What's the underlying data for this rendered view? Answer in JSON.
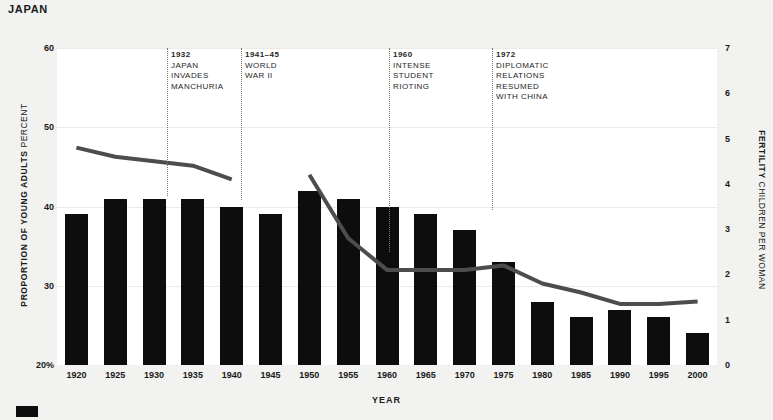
{
  "header": {
    "country": "JAPAN"
  },
  "axes": {
    "left_title_main": "PROPORTION OF YOUNG ADULTS",
    "left_title_sub": "PERCENT",
    "right_title_main": "FERTILITY",
    "right_title_sub": "CHILDREN PER WOMAN",
    "x_title": "YEAR",
    "left_ticks": [
      "60",
      "50",
      "40",
      "30",
      "20%"
    ],
    "right_ticks": [
      "7",
      "6",
      "5",
      "4",
      "3",
      "2",
      "1",
      "0"
    ]
  },
  "events": [
    {
      "year": "1932",
      "text": "JAPAN\nINVADES\nMANCHURIA"
    },
    {
      "year": "1941–45",
      "text": "WORLD\nWAR II"
    },
    {
      "year": "1960",
      "text": "INTENSE\nSTUDENT\nRIOTING"
    },
    {
      "year": "1972",
      "text": "DIPLOMATIC\nRELATIONS\nRESUMED\nWITH CHINA"
    }
  ],
  "chart_data": {
    "type": "bar",
    "title": "JAPAN",
    "xlabel": "YEAR",
    "ylabel": "PROPORTION OF YOUNG ADULTS PERCENT",
    "ylabel_right": "FERTILITY CHILDREN PER WOMAN",
    "ylim": [
      20,
      60
    ],
    "ylim_right": [
      0,
      7
    ],
    "grid": true,
    "legend": "none",
    "categories": [
      "1920",
      "1925",
      "1930",
      "1935",
      "1940",
      "1945",
      "1950",
      "1955",
      "1960",
      "1965",
      "1970",
      "1975",
      "1980",
      "1985",
      "1990",
      "1995",
      "2000"
    ],
    "series": [
      {
        "name": "PROPORTION OF YOUNG ADULTS",
        "type": "bar",
        "unit": "percent",
        "values": [
          39,
          41,
          41,
          41,
          40,
          39,
          42,
          41,
          40,
          39,
          37,
          33,
          28,
          26,
          27,
          26,
          24
        ]
      },
      {
        "name": "FERTILITY",
        "type": "line",
        "unit": "children per woman",
        "values": [
          4.8,
          4.6,
          4.5,
          4.4,
          4.1,
          null,
          4.2,
          2.8,
          2.1,
          2.1,
          2.1,
          2.2,
          1.8,
          1.6,
          1.35,
          1.35,
          1.4
        ]
      }
    ],
    "annotations": [
      {
        "x": "1932",
        "label": "1932 JAPAN INVADES MANCHURIA"
      },
      {
        "x": "1941",
        "label": "1941-45 WORLD WAR II"
      },
      {
        "x": "1960",
        "label": "1960 INTENSE STUDENT RIOTING"
      },
      {
        "x": "1972",
        "label": "1972 DIPLOMATIC RELATIONS RESUMED WITH CHINA"
      }
    ]
  },
  "colors": {
    "bar": "#0d0d0d",
    "line": "#4d4d4d",
    "background": "#f2f2f0",
    "plot_background": "#ffffff",
    "grid": "#eceae6",
    "text": "#1a1a1a"
  }
}
